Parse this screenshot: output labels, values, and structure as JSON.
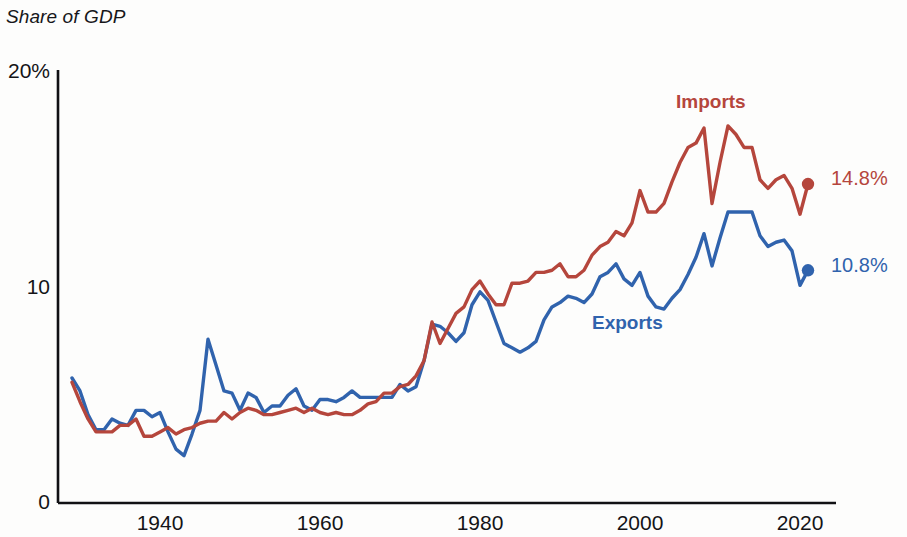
{
  "chart_title": "Share of GDP",
  "colors": {
    "imports": "#b5463c",
    "exports": "#3063ad",
    "axis": "#111114",
    "text": "#141417"
  },
  "axes": {
    "y_ticks": [
      {
        "label": "20%",
        "value": 20
      },
      {
        "label": "10",
        "value": 10
      },
      {
        "label": "0",
        "value": 0
      }
    ],
    "x_ticks": [
      {
        "label": "1940",
        "value": 1940
      },
      {
        "label": "1960",
        "value": 1960
      },
      {
        "label": "1980",
        "value": 1980
      },
      {
        "label": "2000",
        "value": 2000
      },
      {
        "label": "2020",
        "value": 2020
      }
    ]
  },
  "series_labels": {
    "imports": "Imports",
    "exports": "Exports"
  },
  "end_values": {
    "imports": "14.8%",
    "exports": "10.8%"
  },
  "chart_data": {
    "type": "line",
    "title": "Share of GDP",
    "xlabel": "",
    "ylabel": "Share of GDP",
    "xlim": [
      1929,
      2021
    ],
    "ylim": [
      0,
      20
    ],
    "grid": false,
    "legend": "inline-annotations",
    "x": [
      1929,
      1930,
      1931,
      1932,
      1933,
      1934,
      1935,
      1936,
      1937,
      1938,
      1939,
      1940,
      1941,
      1942,
      1943,
      1944,
      1945,
      1946,
      1947,
      1948,
      1949,
      1950,
      1951,
      1952,
      1953,
      1954,
      1955,
      1956,
      1957,
      1958,
      1959,
      1960,
      1961,
      1962,
      1963,
      1964,
      1965,
      1966,
      1967,
      1968,
      1969,
      1970,
      1971,
      1972,
      1973,
      1974,
      1975,
      1976,
      1977,
      1978,
      1979,
      1980,
      1981,
      1982,
      1983,
      1984,
      1985,
      1986,
      1987,
      1988,
      1989,
      1990,
      1991,
      1992,
      1993,
      1994,
      1995,
      1996,
      1997,
      1998,
      1999,
      2000,
      2001,
      2002,
      2003,
      2004,
      2005,
      2006,
      2007,
      2008,
      2009,
      2010,
      2011,
      2012,
      2013,
      2014,
      2015,
      2016,
      2017,
      2018,
      2019,
      2020,
      2021
    ],
    "series": [
      {
        "name": "Exports",
        "color": "#3063ad",
        "end_label": "10.8%",
        "values": [
          5.8,
          5.2,
          4.1,
          3.4,
          3.4,
          3.9,
          3.7,
          3.6,
          4.3,
          4.3,
          4.0,
          4.2,
          3.3,
          2.5,
          2.2,
          3.2,
          4.3,
          7.6,
          6.4,
          5.2,
          5.1,
          4.3,
          5.1,
          4.9,
          4.2,
          4.5,
          4.5,
          5.0,
          5.3,
          4.5,
          4.3,
          4.8,
          4.8,
          4.7,
          4.9,
          5.2,
          4.9,
          4.9,
          4.9,
          4.9,
          4.9,
          5.5,
          5.2,
          5.4,
          6.6,
          8.3,
          8.2,
          7.9,
          7.5,
          7.9,
          9.2,
          9.8,
          9.4,
          8.4,
          7.4,
          7.2,
          7.0,
          7.2,
          7.5,
          8.5,
          9.1,
          9.3,
          9.6,
          9.5,
          9.3,
          9.7,
          10.5,
          10.7,
          11.1,
          10.4,
          10.1,
          10.7,
          9.6,
          9.1,
          9.0,
          9.5,
          9.9,
          10.6,
          11.4,
          12.5,
          11.0,
          12.3,
          13.5,
          13.5,
          13.5,
          13.5,
          12.4,
          11.9,
          12.1,
          12.2,
          11.7,
          10.1,
          10.8
        ]
      },
      {
        "name": "Imports",
        "color": "#b5463c",
        "end_label": "14.8%",
        "values": [
          5.6,
          4.7,
          3.9,
          3.3,
          3.3,
          3.3,
          3.6,
          3.6,
          3.9,
          3.1,
          3.1,
          3.3,
          3.5,
          3.2,
          3.4,
          3.5,
          3.7,
          3.8,
          3.8,
          4.2,
          3.9,
          4.2,
          4.4,
          4.3,
          4.1,
          4.1,
          4.2,
          4.3,
          4.4,
          4.2,
          4.4,
          4.2,
          4.1,
          4.2,
          4.1,
          4.1,
          4.3,
          4.6,
          4.7,
          5.1,
          5.1,
          5.4,
          5.5,
          5.9,
          6.6,
          8.4,
          7.4,
          8.1,
          8.8,
          9.1,
          9.9,
          10.3,
          9.7,
          9.2,
          9.2,
          10.2,
          10.2,
          10.3,
          10.7,
          10.7,
          10.8,
          11.1,
          10.5,
          10.5,
          10.8,
          11.5,
          11.9,
          12.1,
          12.6,
          12.4,
          13.0,
          14.5,
          13.5,
          13.5,
          13.9,
          14.9,
          15.8,
          16.5,
          16.7,
          17.4,
          13.9,
          15.8,
          17.5,
          17.1,
          16.5,
          16.5,
          15.0,
          14.6,
          15.0,
          15.2,
          14.6,
          13.4,
          14.8
        ]
      }
    ]
  }
}
